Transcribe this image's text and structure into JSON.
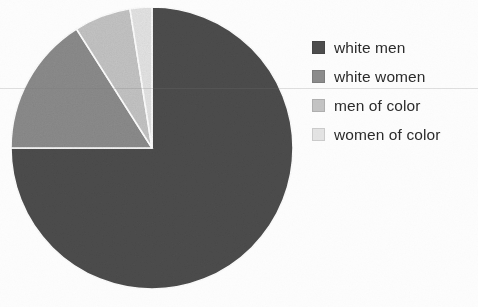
{
  "chart_data": {
    "type": "pie",
    "title": "",
    "categories": [
      "white men",
      "white women",
      "men of color",
      "women of color"
    ],
    "values": [
      75.0,
      16.0,
      6.5,
      2.5
    ],
    "unit": "percent",
    "colors": [
      "#4d4d4d",
      "#8c8c8c",
      "#c4c4c4",
      "#e4e4e4"
    ],
    "start_angle_deg": 0,
    "direction": "clockwise",
    "legend_position": "right",
    "grid": false,
    "xlabel": "",
    "ylabel": "",
    "annotations": [],
    "slices": [
      {
        "label": "white men",
        "value": 75.0,
        "color": "#4d4d4d",
        "start_deg": 0.0,
        "end_deg": 270.0
      },
      {
        "label": "white women",
        "value": 16.0,
        "color": "#8c8c8c",
        "start_deg": 270.0,
        "end_deg": 327.6
      },
      {
        "label": "men of color",
        "value": 6.5,
        "color": "#c4c4c4",
        "start_deg": 327.6,
        "end_deg": 351.0
      },
      {
        "label": "women of color",
        "value": 2.5,
        "color": "#e4e4e4",
        "start_deg": 351.0,
        "end_deg": 360.0
      }
    ]
  },
  "legend": {
    "items": [
      {
        "label": "white men",
        "color": "#4d4d4d"
      },
      {
        "label": "white women",
        "color": "#8c8c8c"
      },
      {
        "label": "men of color",
        "color": "#c4c4c4"
      },
      {
        "label": "women of color",
        "color": "#e4e4e4"
      }
    ]
  },
  "pie": {
    "center_x": 152,
    "center_y": 148,
    "radius": 141
  }
}
